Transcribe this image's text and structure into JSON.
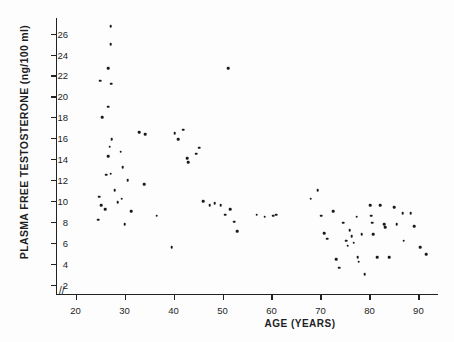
{
  "chart_data": {
    "type": "scatter",
    "title": "",
    "xlabel": "AGE (YEARS)",
    "ylabel": "PLASMA FREE TESTOSTERONE (ng/100 ml)",
    "xlim": [
      16,
      94
    ],
    "ylim": [
      1,
      27.5
    ],
    "xticks": [
      20,
      30,
      40,
      50,
      60,
      70,
      80,
      90
    ],
    "yticks": [
      2,
      4,
      6,
      8,
      10,
      12,
      14,
      16,
      18,
      20,
      22,
      24,
      26
    ],
    "grid": false,
    "legend": null,
    "axis_break_x": true,
    "marker": "dot",
    "marker_color": "#1a1a1a",
    "series": [
      {
        "name": "subjects",
        "points": [
          [
            26.2,
            12.5
          ],
          [
            24.8,
            10.4
          ],
          [
            25.2,
            9.6
          ],
          [
            24.6,
            8.2
          ],
          [
            26.0,
            9.2
          ],
          [
            25.4,
            18.0
          ],
          [
            25.0,
            21.5
          ],
          [
            27.2,
            26.7
          ],
          [
            27.2,
            25.0
          ],
          [
            26.6,
            22.7
          ],
          [
            27.3,
            21.2
          ],
          [
            26.6,
            19.0
          ],
          [
            27.4,
            15.9
          ],
          [
            27.0,
            15.2
          ],
          [
            26.6,
            14.3
          ],
          [
            27.2,
            12.6
          ],
          [
            28.0,
            11.0
          ],
          [
            28.6,
            9.9
          ],
          [
            29.6,
            13.2
          ],
          [
            29.2,
            14.7
          ],
          [
            29.4,
            10.2
          ],
          [
            30.0,
            7.8
          ],
          [
            30.6,
            12.0
          ],
          [
            31.4,
            9.0
          ],
          [
            33.0,
            16.6
          ],
          [
            34.2,
            16.4
          ],
          [
            34.0,
            11.6
          ],
          [
            36.6,
            8.6
          ],
          [
            39.6,
            5.6
          ],
          [
            40.2,
            16.5
          ],
          [
            41.0,
            15.9
          ],
          [
            42.0,
            16.8
          ],
          [
            42.8,
            14.1
          ],
          [
            43.0,
            13.7
          ],
          [
            44.6,
            14.5
          ],
          [
            45.2,
            15.1
          ],
          [
            46.0,
            10.0
          ],
          [
            47.4,
            9.6
          ],
          [
            48.4,
            9.8
          ],
          [
            49.6,
            9.6
          ],
          [
            50.6,
            8.7
          ],
          [
            51.2,
            22.7
          ],
          [
            51.6,
            9.2
          ],
          [
            52.4,
            8.0
          ],
          [
            53.0,
            7.1
          ],
          [
            57.0,
            8.7
          ],
          [
            58.6,
            8.5
          ],
          [
            60.4,
            8.6
          ],
          [
            61.0,
            8.7
          ],
          [
            68.0,
            10.2
          ],
          [
            69.4,
            11.0
          ],
          [
            70.2,
            8.6
          ],
          [
            70.8,
            6.9
          ],
          [
            71.4,
            6.4
          ],
          [
            72.6,
            9.0
          ],
          [
            73.2,
            4.4
          ],
          [
            73.8,
            3.6
          ],
          [
            74.6,
            7.9
          ],
          [
            75.2,
            6.2
          ],
          [
            75.6,
            5.7
          ],
          [
            76.0,
            7.2
          ],
          [
            76.4,
            6.6
          ],
          [
            76.8,
            6.0
          ],
          [
            77.4,
            8.5
          ],
          [
            77.6,
            4.6
          ],
          [
            77.8,
            4.2
          ],
          [
            78.4,
            6.8
          ],
          [
            79.0,
            3.0
          ],
          [
            80.2,
            9.6
          ],
          [
            80.4,
            8.6
          ],
          [
            80.6,
            7.9
          ],
          [
            80.8,
            6.8
          ],
          [
            81.6,
            4.6
          ],
          [
            82.2,
            9.6
          ],
          [
            83.0,
            7.8
          ],
          [
            83.2,
            7.5
          ],
          [
            84.0,
            4.6
          ],
          [
            85.0,
            9.4
          ],
          [
            85.6,
            7.8
          ],
          [
            86.8,
            8.8
          ],
          [
            87.0,
            6.2
          ],
          [
            88.4,
            8.8
          ],
          [
            89.2,
            7.6
          ],
          [
            90.4,
            5.6
          ],
          [
            91.6,
            4.9
          ]
        ]
      }
    ]
  }
}
